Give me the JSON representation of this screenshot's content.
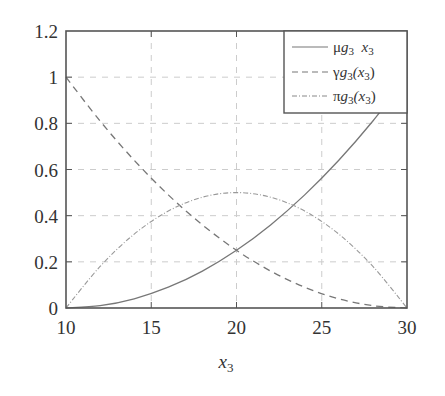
{
  "chart_data": {
    "type": "line",
    "title": "",
    "xlabel": "x3",
    "ylabel": "",
    "xlim": [
      10,
      30
    ],
    "ylim": [
      0,
      1.2
    ],
    "grid": true,
    "legend_position": "upper right",
    "x_ticks": [
      "10",
      "15",
      "20",
      "25",
      "30"
    ],
    "y_ticks": [
      "0",
      "0.2",
      "0.4",
      "0.6",
      "0.8",
      "1",
      "1.2"
    ],
    "x": [
      10,
      12,
      14,
      16,
      18,
      20,
      22,
      24,
      26,
      28,
      30
    ],
    "series": [
      {
        "name": "μg3 x3",
        "style": "solid",
        "values": [
          0,
          0.01,
          0.04,
          0.09,
          0.16,
          0.25,
          0.36,
          0.49,
          0.64,
          0.81,
          1.0
        ]
      },
      {
        "name": "γg3(x3)",
        "style": "dashed",
        "values": [
          1.0,
          0.81,
          0.64,
          0.49,
          0.36,
          0.25,
          0.16,
          0.09,
          0.04,
          0.01,
          0
        ]
      },
      {
        "name": "πg3(x3)",
        "style": "dash-dot",
        "values": [
          0,
          0.18,
          0.32,
          0.42,
          0.48,
          0.5,
          0.48,
          0.42,
          0.32,
          0.18,
          0
        ]
      }
    ]
  },
  "legend": {
    "items": [
      {
        "main": "μ",
        "sub_g": "g",
        "sub_n": "3",
        "arg": "  x",
        "arg_sub": "3"
      },
      {
        "main": "γ",
        "sub_g": "g",
        "sub_n": "3",
        "arg": "(x",
        "arg_sub": "3",
        "close": ")"
      },
      {
        "main": "π",
        "sub_g": "g",
        "sub_n": "3",
        "arg": "(x",
        "arg_sub": "3",
        "close": ")"
      }
    ]
  },
  "axis": {
    "xlabel_main": "x",
    "xlabel_sub": "3"
  }
}
